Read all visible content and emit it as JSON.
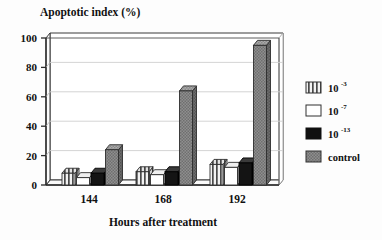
{
  "chart_data": {
    "type": "bar",
    "title": "Apoptotic index (%)",
    "xlabel": "Hours after treatment",
    "ylabel": "Apoptotic index (%)",
    "categories": [
      "144",
      "168",
      "192"
    ],
    "ylim": [
      0,
      100
    ],
    "yticks": [
      "0",
      "20",
      "40",
      "60",
      "80",
      "100"
    ],
    "grid": true,
    "legend_position": "right",
    "style": "3d-clustered-column",
    "series": [
      {
        "name": "10-3",
        "label_base": "10",
        "label_exp": "-3",
        "fill": "vertical-stripes",
        "color": "#9a9a9a",
        "values": [
          8,
          9,
          14
        ]
      },
      {
        "name": "10-7",
        "label_base": "10",
        "label_exp": "-7",
        "fill": "white",
        "color": "#ffffff",
        "values": [
          5,
          7,
          12
        ]
      },
      {
        "name": "10-13",
        "label_base": "10",
        "label_exp": "-13",
        "fill": "solid-black",
        "color": "#101010",
        "values": [
          8,
          9,
          15
        ]
      },
      {
        "name": "control",
        "label_base": "control",
        "label_exp": "",
        "fill": "gray-dotted",
        "color": "#8c8c8c",
        "values": [
          24,
          64,
          95
        ]
      }
    ]
  },
  "legend": {
    "items": [
      {
        "text": "10",
        "sup": "-3"
      },
      {
        "text": "10",
        "sup": "-7"
      },
      {
        "text": "10",
        "sup": "-13"
      },
      {
        "text": "control",
        "sup": ""
      }
    ]
  }
}
